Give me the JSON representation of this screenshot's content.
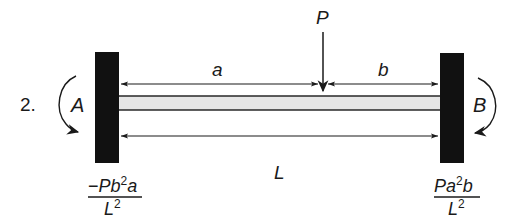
{
  "problem_number": "2.",
  "load": {
    "label": "P"
  },
  "dimensions": {
    "a": "a",
    "b": "b",
    "L": "L"
  },
  "supports": {
    "left": {
      "moment_label": "A",
      "moment_direction": "clockwise"
    },
    "right": {
      "moment_label": "B",
      "moment_direction": "clockwise"
    }
  },
  "reactions": {
    "left": {
      "numerator_sign": "−",
      "numerator_P": "P",
      "numerator_b": "b",
      "numerator_b_exp": "2",
      "numerator_a": "a",
      "denominator_L": "L",
      "denominator_exp": "2"
    },
    "right": {
      "numerator_P": "P",
      "numerator_a": "a",
      "numerator_a_exp": "2",
      "numerator_b": "b",
      "denominator_L": "L",
      "denominator_exp": "2"
    }
  },
  "colors": {
    "wall": "#111111",
    "beam_fill": "#e6e6e6",
    "line": "#1a1a1a"
  }
}
